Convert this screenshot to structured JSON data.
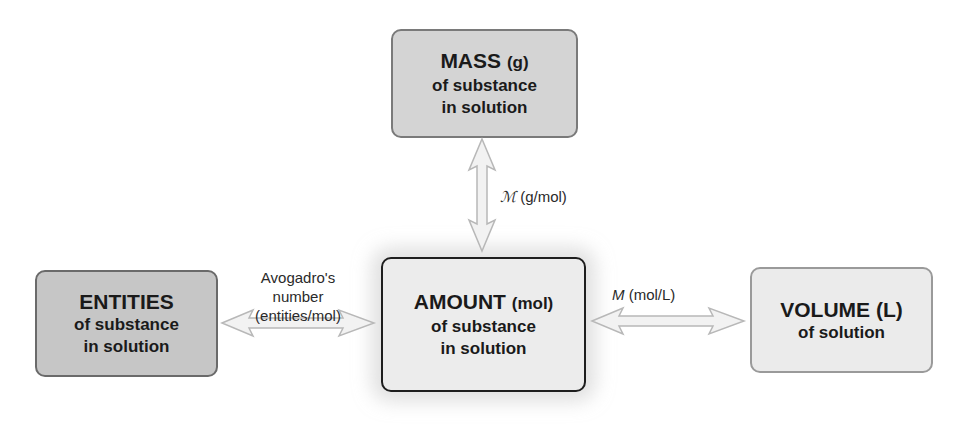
{
  "boxes": {
    "mass": {
      "title": "MASS",
      "unit": "(g)",
      "line1": "of substance",
      "line2": "in solution"
    },
    "entities": {
      "title": "ENTITIES",
      "line1": "of substance",
      "line2": "in solution"
    },
    "amount": {
      "title": "AMOUNT",
      "unit": "(mol)",
      "line1": "of substance",
      "line2": "in solution"
    },
    "volume": {
      "title": "VOLUME (L)",
      "line1": "of solution"
    }
  },
  "connectors": {
    "avogadro": {
      "line1": "Avogadro's",
      "line2": "number",
      "line3": "(entities/mol)"
    },
    "molar_mass": {
      "symbol": "ℳ",
      "unit": "(g/mol)"
    },
    "molarity": {
      "symbol": "M",
      "unit": "(mol/L)"
    }
  },
  "colors": {
    "arrow_fill": "#f2f2f2",
    "arrow_stroke": "#b8b8b8"
  }
}
